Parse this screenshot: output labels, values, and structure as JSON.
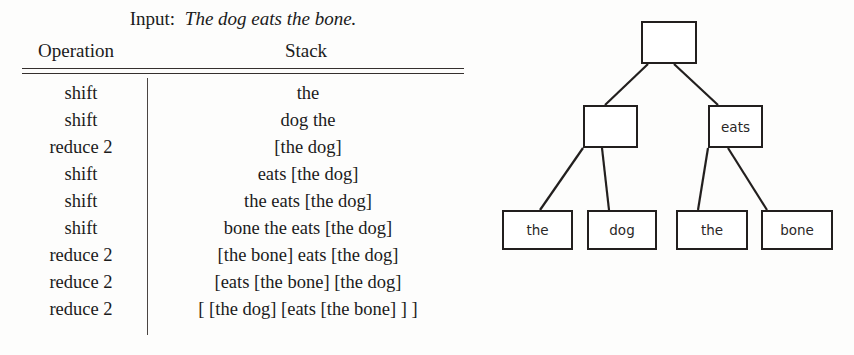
{
  "figure": {
    "caption_label": "Input:",
    "caption_sentence": "The dog eats the bone."
  },
  "table": {
    "columns": [
      "Operation",
      "Stack"
    ],
    "rows": [
      {
        "operation": "shift",
        "stack": "the"
      },
      {
        "operation": "shift",
        "stack": "dog the"
      },
      {
        "operation": "reduce 2",
        "stack": "[the dog]"
      },
      {
        "operation": "shift",
        "stack": "eats [the dog]"
      },
      {
        "operation": "shift",
        "stack": "the eats [the dog]"
      },
      {
        "operation": "shift",
        "stack": "bone the eats [the dog]"
      },
      {
        "operation": "reduce 2",
        "stack": "[the bone] eats [the dog]"
      },
      {
        "operation": "reduce 2",
        "stack": "[eats [the bone] [the dog]"
      },
      {
        "operation": "reduce 2",
        "stack": "[ [the dog] [eats [the bone] ] ]"
      }
    ]
  },
  "tree": {
    "nodes": [
      {
        "id": "root",
        "label": ""
      },
      {
        "id": "np",
        "label": ""
      },
      {
        "id": "vp",
        "label": "eats"
      },
      {
        "id": "leaf-1",
        "label": "the"
      },
      {
        "id": "leaf-2",
        "label": "dog"
      },
      {
        "id": "leaf-3",
        "label": "the"
      },
      {
        "id": "leaf-4",
        "label": "bone"
      }
    ]
  },
  "colors": {
    "ink": "#1a1a1a",
    "box_border": "#221f1e",
    "rule": "#35302e",
    "background": "#fdfdfc"
  }
}
